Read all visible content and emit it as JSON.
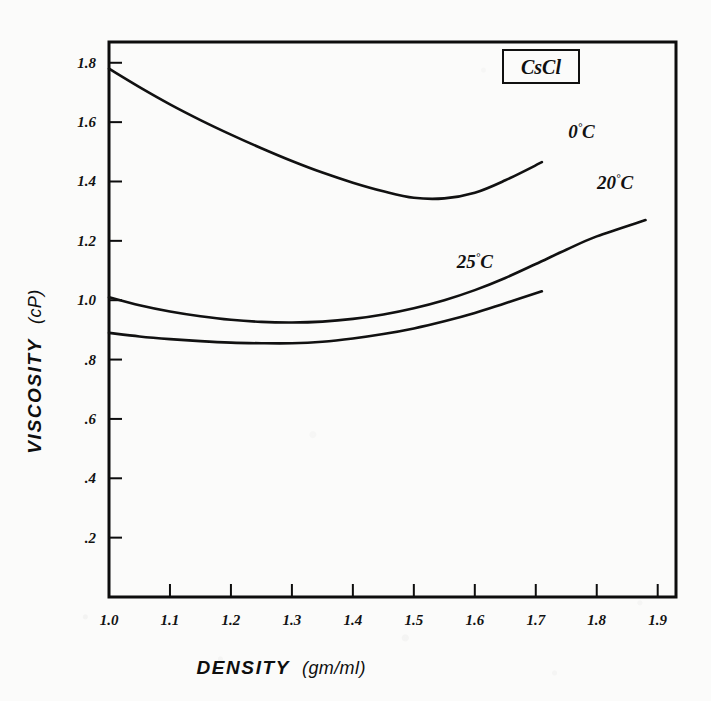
{
  "figure": {
    "legend_label": "CsCl",
    "background_color": "#fbfbfa",
    "ink_color": "#111111"
  },
  "chart_data": {
    "type": "line",
    "title": "",
    "subtitle": "",
    "annotation_box": "CsCl",
    "xlabel": "DENSITY",
    "xlabel_unit": "(gm/ml)",
    "ylabel": "VISCOSITY",
    "ylabel_unit": "(cP)",
    "xlim": [
      1.0,
      1.93
    ],
    "ylim": [
      0.0,
      1.87
    ],
    "grid": false,
    "legend_position": "inline-curve-labels",
    "xticks": [
      1.0,
      1.1,
      1.2,
      1.3,
      1.4,
      1.5,
      1.6,
      1.7,
      1.8,
      1.9
    ],
    "xtick_labels": [
      "1.0",
      "1.1",
      "1.2",
      "1.3",
      "1.4",
      "1.5",
      "1.6",
      "1.7",
      "1.8",
      "1.9"
    ],
    "yticks": [
      0.2,
      0.4,
      0.6,
      0.8,
      1.0,
      1.2,
      1.4,
      1.6,
      1.8
    ],
    "ytick_labels": [
      ".2",
      ".4",
      ".6",
      ".8",
      "1.0",
      "1.2",
      "1.4",
      "1.6",
      "1.8"
    ],
    "series": [
      {
        "name": "0°C",
        "label_text": "0",
        "label_degree": "°",
        "label_unit": "C",
        "x": [
          1.0,
          1.05,
          1.1,
          1.15,
          1.2,
          1.25,
          1.3,
          1.35,
          1.4,
          1.45,
          1.5,
          1.55,
          1.6,
          1.65,
          1.71
        ],
        "values": [
          1.78,
          1.718,
          1.66,
          1.607,
          1.558,
          1.512,
          1.469,
          1.43,
          1.396,
          1.367,
          1.345,
          1.343,
          1.362,
          1.404,
          1.465
        ]
      },
      {
        "name": "20°C",
        "label_text": "20",
        "label_degree": "°",
        "label_unit": "C",
        "x": [
          1.0,
          1.05,
          1.1,
          1.15,
          1.2,
          1.25,
          1.3,
          1.35,
          1.4,
          1.45,
          1.5,
          1.55,
          1.6,
          1.65,
          1.7,
          1.75,
          1.8,
          1.88
        ],
        "values": [
          1.01,
          0.983,
          0.962,
          0.946,
          0.934,
          0.927,
          0.925,
          0.928,
          0.937,
          0.952,
          0.973,
          1.0,
          1.034,
          1.075,
          1.122,
          1.17,
          1.215,
          1.27
        ]
      },
      {
        "name": "25°C",
        "label_text": "25",
        "label_degree": "°",
        "label_unit": "C",
        "x": [
          1.0,
          1.05,
          1.1,
          1.15,
          1.2,
          1.25,
          1.3,
          1.35,
          1.4,
          1.45,
          1.5,
          1.55,
          1.6,
          1.65,
          1.71
        ],
        "values": [
          0.89,
          0.878,
          0.869,
          0.862,
          0.857,
          0.855,
          0.855,
          0.86,
          0.871,
          0.886,
          0.905,
          0.929,
          0.957,
          0.99,
          1.03
        ]
      }
    ],
    "curve_label_positions": [
      {
        "series": "0°C",
        "x": 1.775,
        "y": 1.545
      },
      {
        "series": "20°C",
        "x": 1.83,
        "y": 1.375
      },
      {
        "series": "25°C",
        "x": 1.6,
        "y": 1.11
      }
    ]
  }
}
